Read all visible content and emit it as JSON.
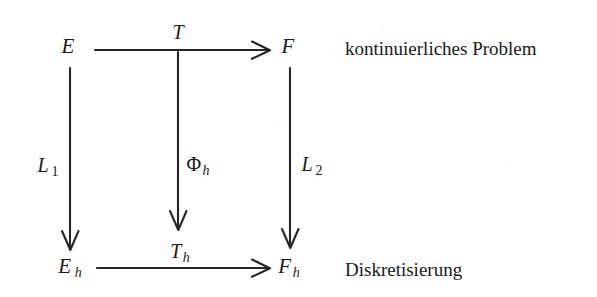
{
  "diagram": {
    "type": "commutative-diagram",
    "background_color": "#fefefe",
    "ink_color": "#262626",
    "nodes": [
      {
        "id": "E",
        "label": "E",
        "subscript": "",
        "x": 68,
        "y": 46
      },
      {
        "id": "F",
        "label": "F",
        "subscript": "",
        "x": 288,
        "y": 46
      },
      {
        "id": "Eh",
        "label": "E",
        "subscript": "h",
        "x": 70,
        "y": 268
      },
      {
        "id": "Fh",
        "label": "F",
        "subscript": "h",
        "x": 289,
        "y": 268
      }
    ],
    "arrows": [
      {
        "id": "T",
        "from": "E",
        "to": "F",
        "orientation": "horizontal",
        "label": "T",
        "subscript": "",
        "label_x": 178,
        "label_y": 32,
        "x1": 95,
        "y1": 50,
        "x2": 268,
        "y2": 50
      },
      {
        "id": "Th",
        "from": "Eh",
        "to": "Fh",
        "orientation": "horizontal",
        "label": "T",
        "subscript": "h",
        "label_x": 180,
        "label_y": 253,
        "x1": 97,
        "y1": 268,
        "x2": 268,
        "y2": 268
      },
      {
        "id": "L1",
        "from": "E",
        "to": "Eh",
        "orientation": "vertical",
        "label": "L",
        "subscript": "1",
        "label_x": 48,
        "label_y": 167,
        "x1": 70,
        "y1": 68,
        "x2": 70,
        "y2": 248
      },
      {
        "id": "Phih",
        "from": "T",
        "to": "Th",
        "orientation": "vertical",
        "label": "Φ",
        "subscript": "h",
        "label_x": 198,
        "label_y": 166,
        "x1": 178,
        "y1": 52,
        "x2": 178,
        "y2": 228
      },
      {
        "id": "L2",
        "from": "F",
        "to": "Fh",
        "orientation": "vertical",
        "label": "L",
        "subscript": "2",
        "label_x": 312,
        "label_y": 166,
        "x1": 290,
        "y1": 68,
        "x2": 290,
        "y2": 246
      }
    ],
    "captions": [
      {
        "id": "top-caption",
        "text": "kontinuierliches Problem",
        "x": 345,
        "y": 48
      },
      {
        "id": "bottom-caption",
        "text": "Diskretisierung",
        "x": 345,
        "y": 269
      }
    ]
  }
}
